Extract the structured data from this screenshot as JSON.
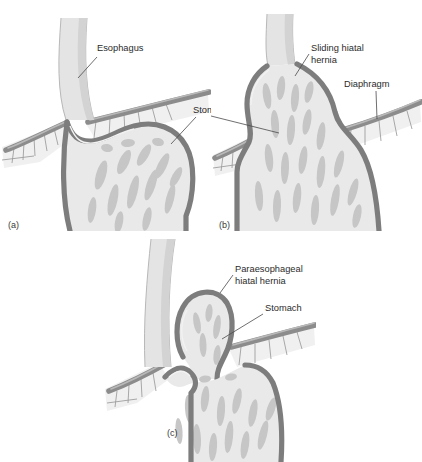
{
  "figure": {
    "background_color": "#ffffff",
    "ink_color": "#2b2b2b",
    "tissue_wall_color": "#7d7d7d",
    "tissue_lumen_color": "#e9e9e9",
    "rugae_color": "#c6c6c6",
    "diaphragm_color": "#8c8c8c"
  },
  "panels": [
    {
      "id": "a",
      "panel_label": "(a)",
      "condition": "normal anatomy",
      "labels": [
        {
          "key": "esophagus",
          "text": "Esophagus"
        },
        {
          "key": "stomach",
          "text": "Stomach"
        }
      ]
    },
    {
      "id": "b",
      "panel_label": "(b)",
      "condition": "sliding hiatal hernia",
      "labels": [
        {
          "key": "sliding_hernia_line1",
          "text": "Sliding hiatal"
        },
        {
          "key": "sliding_hernia_line2",
          "text": "hernia"
        },
        {
          "key": "diaphragm",
          "text": "Diaphragm"
        },
        {
          "key": "stomach",
          "text": "Stomach"
        }
      ]
    },
    {
      "id": "c",
      "panel_label": "(c)",
      "condition": "paraesophageal hiatal hernia",
      "labels": [
        {
          "key": "paraesophageal_line1",
          "text": "Paraesophageal"
        },
        {
          "key": "paraesophageal_line2",
          "text": "hiatal hernia"
        },
        {
          "key": "stomach",
          "text": "Stomach"
        }
      ]
    }
  ]
}
